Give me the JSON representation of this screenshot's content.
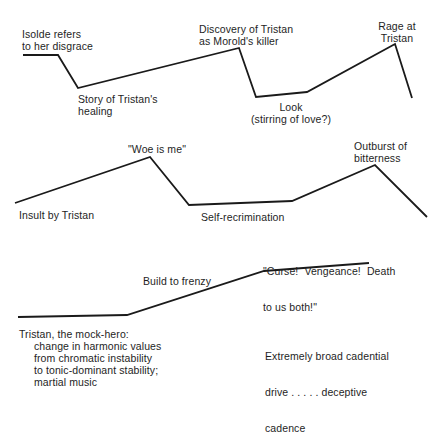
{
  "diagram": {
    "rows": [
      {
        "id": "row1",
        "points": "23,55 58,55 78,88 239,48 256,97 307,92 395,44 412,98",
        "labels": [
          {
            "lines": [
              "Isolde refers",
              "to her disgrace"
            ]
          },
          {
            "lines": [
              "Story of Tristan's",
              "healing"
            ]
          },
          {
            "lines": [
              "Discovery of Tristan",
              "as Morold's killer"
            ]
          },
          {
            "lines": [
              "Look",
              "(stirring of love?)"
            ]
          },
          {
            "lines": [
              "Rage at",
              "Tristan"
            ]
          }
        ]
      },
      {
        "id": "row2",
        "points": "15,203 150,157 189,205 292,201 375,165 427,217",
        "labels": [
          {
            "lines": [
              "\"Woe is me\""
            ]
          },
          {
            "lines": [
              "Insult by Tristan"
            ]
          },
          {
            "lines": [
              "Self-recrimination"
            ]
          },
          {
            "lines": [
              "Outburst of",
              "bitterness"
            ]
          }
        ]
      },
      {
        "id": "row3",
        "points": "18,317 127,315 264,271 369,263",
        "labels": [
          {
            "lines": [
              "\"Curse!  Vengeance!  Death",
              "to us both!\""
            ]
          },
          {
            "lines": [
              "Build to frenzy"
            ]
          },
          {
            "lines": [
              "Tristan, the mock-hero:",
              "change in harmonic values",
              "from chromatic instability",
              "to tonic-dominant stability;",
              "martial music"
            ]
          },
          {
            "lines": [
              "Extremely broad cadential",
              "drive . . . . . deceptive",
              "cadence"
            ]
          }
        ]
      }
    ]
  }
}
